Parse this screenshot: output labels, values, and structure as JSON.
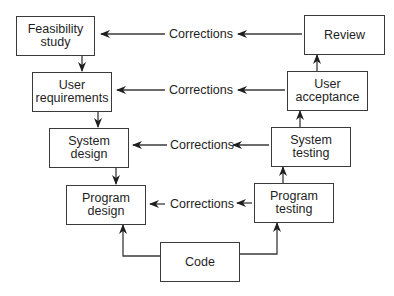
{
  "diagram": {
    "type": "V-model software development lifecycle",
    "left_stages": [
      {
        "id": "feasibility",
        "label": "Feasibility\nstudy"
      },
      {
        "id": "user-requirements",
        "label": "User\nrequirements"
      },
      {
        "id": "system-design",
        "label": "System\ndesign"
      },
      {
        "id": "program-design",
        "label": "Program\ndesign"
      }
    ],
    "bottom_stage": {
      "id": "code",
      "label": "Code"
    },
    "right_stages": [
      {
        "id": "program-testing",
        "label": "Program\ntesting"
      },
      {
        "id": "system-testing",
        "label": "System\ntesting"
      },
      {
        "id": "user-acceptance",
        "label": "User\nacceptance"
      },
      {
        "id": "review",
        "label": "Review"
      }
    ],
    "corrections": [
      {
        "from": "review",
        "to": "feasibility",
        "label": "Corrections"
      },
      {
        "from": "user-acceptance",
        "to": "user-requirements",
        "label": "Corrections"
      },
      {
        "from": "system-testing",
        "to": "system-design",
        "label": "Corrections"
      },
      {
        "from": "program-testing",
        "to": "program-design",
        "label": "Corrections"
      }
    ],
    "colors": {
      "line": "#3a3a3a",
      "text": "#1e1e1e",
      "background": "#ffffff"
    }
  }
}
